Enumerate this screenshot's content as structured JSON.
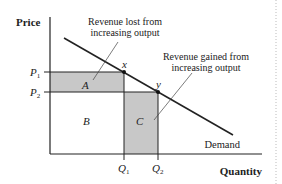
{
  "diagram": {
    "type": "demand-revenue-tradeoff",
    "y_axis_label": "Price",
    "x_axis_label": "Quantity",
    "price_levels": [
      {
        "label": "P",
        "sub": "1"
      },
      {
        "label": "P",
        "sub": "2"
      }
    ],
    "quantity_levels": [
      {
        "label": "Q",
        "sub": "1"
      },
      {
        "label": "Q",
        "sub": "2"
      }
    ],
    "points": {
      "x": "x",
      "y": "y"
    },
    "regions": {
      "A": "A",
      "B": "B",
      "C": "C"
    },
    "curve_label": "Demand",
    "annotations": {
      "lost_line1": "Revenue lost from",
      "lost_line2": "increasing output",
      "gained_line1": "Revenue gained from",
      "gained_line2": "increasing output"
    },
    "colors": {
      "shaded": "#c8c8c8",
      "line": "#222222",
      "divider": "#bbbbbb"
    }
  }
}
